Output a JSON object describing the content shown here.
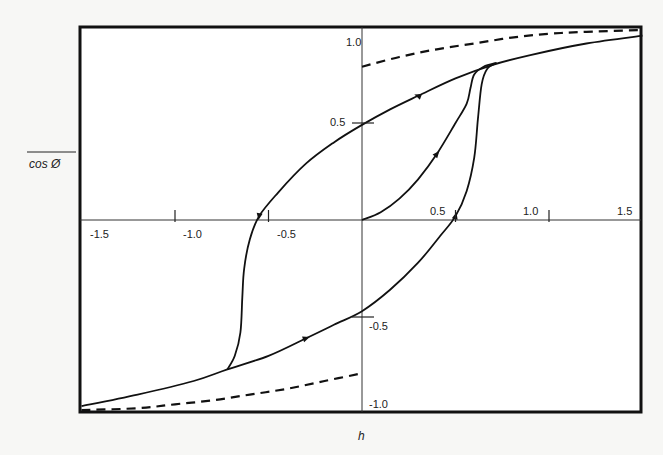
{
  "chart_data": {
    "type": "line",
    "title": "",
    "xlabel": "h",
    "ylabel": "cos Ø (overlined)",
    "xlim": [
      -1.5,
      1.5
    ],
    "ylim": [
      -1.0,
      1.0
    ],
    "grid": false,
    "legend": null,
    "x_ticks": [
      {
        "value": -1.5,
        "label": "-1.5"
      },
      {
        "value": -1.0,
        "label": "-1.0"
      },
      {
        "value": -0.5,
        "label": "-0.5"
      },
      {
        "value": 0.5,
        "label": "0.5"
      },
      {
        "value": 1.0,
        "label": "1.0"
      },
      {
        "value": 1.5,
        "label": "1.5"
      }
    ],
    "y_ticks": [
      {
        "value": 1.0,
        "label": "1.0"
      },
      {
        "value": 0.5,
        "label": "0.5"
      },
      {
        "value": -0.5,
        "label": "-0.5"
      },
      {
        "value": -1.0,
        "label": "-1.0"
      }
    ],
    "series": [
      {
        "name": "upper hysteresis branch (decreasing h)",
        "style": "solid",
        "points": [
          [
            1.5,
            0.95
          ],
          [
            1.2,
            0.91
          ],
          [
            0.9,
            0.85
          ],
          [
            0.7,
            0.8
          ],
          [
            0.5,
            0.73
          ],
          [
            0.3,
            0.64
          ],
          [
            0.15,
            0.57
          ],
          [
            0.0,
            0.49
          ],
          [
            -0.15,
            0.4
          ],
          [
            -0.3,
            0.29
          ],
          [
            -0.45,
            0.14
          ],
          [
            -0.55,
            0.02
          ],
          [
            -0.6,
            -0.1
          ],
          [
            -0.63,
            -0.25
          ],
          [
            -0.64,
            -0.4
          ],
          [
            -0.65,
            -0.58
          ],
          [
            -0.68,
            -0.7
          ],
          [
            -0.72,
            -0.77
          ]
        ]
      },
      {
        "name": "lower hysteresis branch (increasing h)",
        "style": "solid",
        "points": [
          [
            -1.5,
            -0.96
          ],
          [
            -1.2,
            -0.9
          ],
          [
            -0.9,
            -0.83
          ],
          [
            -0.72,
            -0.77
          ],
          [
            -0.5,
            -0.7
          ],
          [
            -0.3,
            -0.61
          ],
          [
            -0.15,
            -0.54
          ],
          [
            0.0,
            -0.47
          ],
          [
            0.15,
            -0.36
          ],
          [
            0.3,
            -0.22
          ],
          [
            0.42,
            -0.08
          ],
          [
            0.5,
            0.02
          ],
          [
            0.56,
            0.15
          ],
          [
            0.6,
            0.32
          ],
          [
            0.62,
            0.52
          ],
          [
            0.64,
            0.7
          ],
          [
            0.67,
            0.78
          ],
          [
            0.72,
            0.81
          ]
        ]
      },
      {
        "name": "initial magnetization curve",
        "style": "solid",
        "points": [
          [
            0.0,
            0.0
          ],
          [
            0.1,
            0.04
          ],
          [
            0.2,
            0.11
          ],
          [
            0.3,
            0.21
          ],
          [
            0.4,
            0.34
          ],
          [
            0.5,
            0.5
          ],
          [
            0.56,
            0.6
          ],
          [
            0.58,
            0.68
          ],
          [
            0.6,
            0.75
          ],
          [
            0.65,
            0.79
          ],
          [
            0.72,
            0.81
          ]
        ]
      },
      {
        "name": "upper limiting curve",
        "style": "dashed",
        "points": [
          [
            0.0,
            0.79
          ],
          [
            0.2,
            0.84
          ],
          [
            0.4,
            0.88
          ],
          [
            0.6,
            0.91
          ],
          [
            0.8,
            0.94
          ],
          [
            1.0,
            0.96
          ],
          [
            1.2,
            0.97
          ],
          [
            1.5,
            0.98
          ]
        ]
      },
      {
        "name": "lower limiting curve",
        "style": "dashed",
        "points": [
          [
            -1.5,
            -0.98
          ],
          [
            -1.2,
            -0.97
          ],
          [
            -1.0,
            -0.95
          ],
          [
            -0.8,
            -0.93
          ],
          [
            -0.6,
            -0.9
          ],
          [
            -0.4,
            -0.87
          ],
          [
            -0.2,
            -0.83
          ],
          [
            0.0,
            -0.79
          ]
        ]
      }
    ],
    "annotations": [
      {
        "type": "arrow",
        "series": "upper hysteresis branch (decreasing h)",
        "at": [
          0.3,
          0.64
        ],
        "direction": "left"
      },
      {
        "type": "arrow",
        "series": "upper hysteresis branch (decreasing h)",
        "at": [
          -0.55,
          0.02
        ],
        "direction": "down"
      },
      {
        "type": "arrow",
        "series": "lower hysteresis branch (increasing h)",
        "at": [
          -0.3,
          -0.61
        ],
        "direction": "right"
      },
      {
        "type": "arrow",
        "series": "lower hysteresis branch (increasing h)",
        "at": [
          0.5,
          0.02
        ],
        "direction": "up"
      },
      {
        "type": "arrow",
        "series": "initial magnetization curve",
        "at": [
          0.4,
          0.34
        ],
        "direction": "up-right"
      }
    ]
  }
}
